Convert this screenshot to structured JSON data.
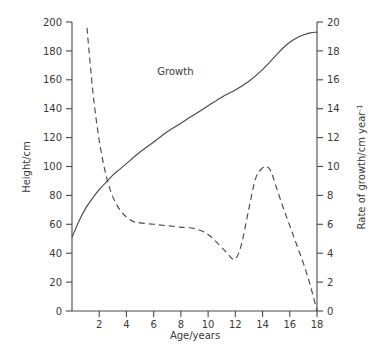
{
  "chart_data": {
    "type": "line",
    "title": "",
    "xlabel": "Age/years",
    "ylabel": "Height/cm",
    "y2label": "Rate of growth/cm year",
    "y2label_sup": "-1",
    "xlim": [
      0,
      18
    ],
    "ylim": [
      0,
      200
    ],
    "y2lim": [
      0,
      20
    ],
    "grid": false,
    "legend": "inline-annotations",
    "x_ticks": [
      2,
      4,
      6,
      8,
      10,
      12,
      14,
      16,
      18
    ],
    "x_tick_labels": [
      "2",
      "4",
      "6",
      "8",
      "10",
      "12",
      "14",
      "16",
      "18"
    ],
    "y_ticks": [
      0,
      20,
      40,
      60,
      80,
      100,
      120,
      140,
      160,
      180,
      200
    ],
    "y_tick_labels": [
      "0",
      "20",
      "40",
      "60",
      "80",
      "100",
      "120",
      "140",
      "160",
      "180",
      "200"
    ],
    "y2_ticks": [
      0,
      2,
      4,
      6,
      8,
      10,
      12,
      14,
      16,
      18,
      20
    ],
    "y2_tick_labels": [
      "0",
      "2",
      "4",
      "6",
      "8",
      "10",
      "12",
      "14",
      "16",
      "18",
      "20"
    ],
    "annotations": [
      {
        "text": "Growth",
        "x": 7.6,
        "y": 163,
        "axis": "left"
      },
      {
        "text": "Growth rate",
        "x": 5.2,
        "y": 70,
        "axis": "right"
      }
    ],
    "series": [
      {
        "name": "Growth",
        "style": "solid",
        "axis": "left",
        "unit": "cm",
        "x": [
          0.0,
          0.5,
          1.0,
          1.5,
          2.0,
          2.5,
          3.0,
          3.5,
          4.0,
          5.0,
          6.0,
          7.0,
          8.0,
          9.0,
          10.0,
          11.0,
          12.0,
          13.0,
          14.0,
          15.0,
          15.5,
          16.0,
          16.5,
          17.0,
          17.5,
          18.0
        ],
        "values": [
          51,
          62,
          71,
          78,
          84,
          89,
          94,
          98,
          102,
          110,
          117,
          124,
          130,
          136,
          142,
          148,
          153,
          159,
          167,
          177,
          182,
          186,
          189,
          191,
          192.5,
          193
        ]
      },
      {
        "name": "Growth rate",
        "style": "dashed",
        "axis": "right",
        "unit": "cm year^-1",
        "x": [
          1.1,
          1.3,
          1.6,
          2.0,
          2.4,
          2.8,
          3.2,
          3.6,
          4.0,
          4.5,
          5.0,
          6.0,
          7.0,
          8.0,
          9.0,
          10.0,
          11.0,
          11.5,
          11.8,
          12.1,
          12.5,
          13.0,
          13.5,
          14.0,
          14.3,
          14.6,
          15.0,
          15.5,
          16.0,
          16.5,
          17.0,
          17.5,
          18.0
        ],
        "values": [
          19.6,
          17.5,
          14.6,
          11.8,
          9.8,
          8.4,
          7.5,
          6.9,
          6.5,
          6.2,
          6.1,
          6.0,
          5.9,
          5.8,
          5.7,
          5.3,
          4.4,
          3.9,
          3.6,
          3.7,
          4.8,
          7.1,
          9.2,
          9.9,
          10.0,
          9.7,
          8.6,
          7.2,
          5.9,
          4.6,
          3.3,
          1.8,
          0.0
        ]
      }
    ]
  },
  "plot": {
    "left_px": 72,
    "right_px": 317,
    "top_px": 22,
    "bottom_px": 311
  }
}
